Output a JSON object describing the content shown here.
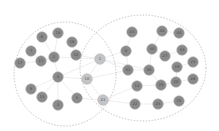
{
  "colors": {
    "node": "#8a8a8a",
    "node_stroke": "#b5b5b5",
    "shared_node": "#c4c4c4",
    "edge": "#e2e2e2",
    "cluster_border": "#bdbdbd",
    "label": "#4a4a4a"
  },
  "clusters": [
    {
      "name": "left-cluster",
      "cx": 65,
      "cy": 74,
      "rx": 51,
      "ry": 52
    },
    {
      "name": "right-cluster",
      "cx": 143,
      "cy": 68,
      "rx": 63,
      "ry": 53
    }
  ],
  "nodes": [
    {
      "id": "6",
      "x": 42,
      "y": 37,
      "group": "left"
    },
    {
      "id": "18",
      "x": 58,
      "y": 33,
      "group": "left"
    },
    {
      "id": "16",
      "x": 72,
      "y": 42,
      "group": "left"
    },
    {
      "id": "7",
      "x": 31,
      "y": 51,
      "group": "left"
    },
    {
      "id": "11",
      "x": 41,
      "y": 61,
      "group": "left"
    },
    {
      "id": "2",
      "x": 54,
      "y": 57,
      "group": "left"
    },
    {
      "id": "12",
      "x": 76,
      "y": 55,
      "group": "left"
    },
    {
      "id": "17",
      "x": 20,
      "y": 63,
      "group": "left"
    },
    {
      "id": "3",
      "x": 58,
      "y": 77,
      "group": "left"
    },
    {
      "id": "9",
      "x": 31,
      "y": 89,
      "group": "left"
    },
    {
      "id": "13",
      "x": 42,
      "y": 97,
      "group": "left"
    },
    {
      "id": "4",
      "x": 58,
      "y": 105,
      "group": "left"
    },
    {
      "id": "5",
      "x": 77,
      "y": 98,
      "group": "left"
    },
    {
      "id": "10",
      "x": 87,
      "y": 79,
      "group": "shared"
    },
    {
      "id": "1",
      "x": 100,
      "y": 59,
      "group": "shared"
    },
    {
      "id": "21",
      "x": 103,
      "y": 100,
      "group": "shared"
    },
    {
      "id": "24",
      "x": 132,
      "y": 32,
      "group": "right"
    },
    {
      "id": "32",
      "x": 162,
      "y": 31,
      "group": "right"
    },
    {
      "id": "34",
      "x": 179,
      "y": 33,
      "group": "right"
    },
    {
      "id": "8",
      "x": 126,
      "y": 51,
      "group": "right"
    },
    {
      "id": "30",
      "x": 152,
      "y": 49,
      "group": "right"
    },
    {
      "id": "27",
      "x": 165,
      "y": 56,
      "group": "right"
    },
    {
      "id": "33",
      "x": 182,
      "y": 50,
      "group": "right"
    },
    {
      "id": "31",
      "x": 128,
      "y": 70,
      "group": "right"
    },
    {
      "id": "26",
      "x": 149,
      "y": 70,
      "group": "right"
    },
    {
      "id": "19",
      "x": 177,
      "y": 67,
      "group": "right"
    },
    {
      "id": "23",
      "x": 193,
      "y": 62,
      "group": "right"
    },
    {
      "id": "14",
      "x": 137,
      "y": 86,
      "group": "right"
    },
    {
      "id": "29",
      "x": 161,
      "y": 85,
      "group": "right"
    },
    {
      "id": "20",
      "x": 176,
      "y": 82,
      "group": "right"
    },
    {
      "id": "28",
      "x": 193,
      "y": 79,
      "group": "right"
    },
    {
      "id": "22",
      "x": 135,
      "y": 104,
      "group": "right"
    },
    {
      "id": "25",
      "x": 158,
      "y": 104,
      "group": "right"
    },
    {
      "id": "15",
      "x": 179,
      "y": 101,
      "group": "right"
    }
  ],
  "edges": [
    [
      "1",
      "2"
    ],
    [
      "1",
      "3"
    ],
    [
      "1",
      "12"
    ],
    [
      "1",
      "10"
    ],
    [
      "1",
      "31"
    ],
    [
      "1",
      "8"
    ],
    [
      "1",
      "26"
    ],
    [
      "2",
      "3"
    ],
    [
      "2",
      "11"
    ],
    [
      "2",
      "18"
    ],
    [
      "2",
      "6"
    ],
    [
      "3",
      "4"
    ],
    [
      "3",
      "5"
    ],
    [
      "3",
      "9"
    ],
    [
      "3",
      "13"
    ],
    [
      "3",
      "10"
    ],
    [
      "7",
      "11"
    ],
    [
      "17",
      "11"
    ],
    [
      "12",
      "16"
    ],
    [
      "5",
      "21"
    ],
    [
      "10",
      "21"
    ],
    [
      "21",
      "14"
    ],
    [
      "21",
      "22"
    ],
    [
      "10",
      "31"
    ],
    [
      "31",
      "26"
    ],
    [
      "26",
      "30"
    ],
    [
      "26",
      "29"
    ],
    [
      "30",
      "27"
    ],
    [
      "27",
      "33"
    ],
    [
      "24",
      "8"
    ],
    [
      "8",
      "31"
    ],
    [
      "29",
      "20"
    ],
    [
      "20",
      "19"
    ],
    [
      "19",
      "23"
    ],
    [
      "28",
      "20"
    ],
    [
      "14",
      "29"
    ],
    [
      "22",
      "25"
    ],
    [
      "25",
      "15"
    ],
    [
      "32",
      "34"
    ],
    [
      "30",
      "32"
    ]
  ]
}
